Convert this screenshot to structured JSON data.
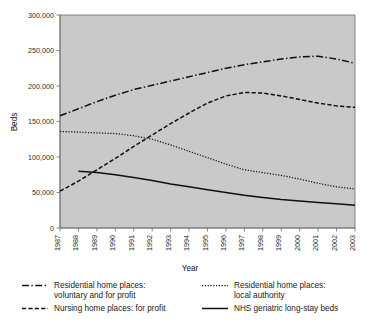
{
  "chart_data": {
    "type": "line",
    "title": "",
    "xlabel": "Year",
    "ylabel": "Beds",
    "x": [
      1987,
      1988,
      1989,
      1990,
      1991,
      1992,
      1993,
      1994,
      1995,
      1996,
      1997,
      1998,
      1999,
      2000,
      2001,
      2002,
      2003
    ],
    "categories": [
      "1987",
      "1988",
      "1989",
      "1990",
      "1991",
      "1992",
      "1993",
      "1994",
      "1995",
      "1996",
      "1997",
      "1998",
      "1999",
      "2000",
      "2001",
      "2002",
      "2003"
    ],
    "xlim": [
      1987,
      2003
    ],
    "ylim": [
      0,
      300000
    ],
    "yticks": [
      0,
      50000,
      100000,
      150000,
      200000,
      250000,
      300000
    ],
    "ytick_labels": [
      "0",
      "50,000",
      "100,000",
      "150,000",
      "200,000",
      "250,000",
      "300,000"
    ],
    "grid": false,
    "legend_position": "bottom",
    "plot_background": "#c9c9c9",
    "series": [
      {
        "name": "Residential home places: voluntary and for profit",
        "legend_label_line1": "Residential home places:",
        "legend_label_line2": "voluntary and for profit",
        "style": "dash-dot",
        "color": "#0f0f0f",
        "values": [
          158000,
          168000,
          178000,
          187000,
          195000,
          201000,
          207000,
          213000,
          219000,
          225000,
          230000,
          234000,
          238000,
          241000,
          242000,
          238000,
          232000
        ]
      },
      {
        "name": "Nursing home places: for profit",
        "legend_label_line1": "Nursing home places: for profit",
        "legend_label_line2": "",
        "style": "dashed",
        "color": "#0f0f0f",
        "values": [
          52000,
          66000,
          82000,
          98000,
          115000,
          131000,
          147000,
          162000,
          176000,
          186000,
          191000,
          190000,
          186000,
          181000,
          176000,
          172000,
          170000
        ]
      },
      {
        "name": "Residential home places: local authority",
        "legend_label_line1": "Residential home places:",
        "legend_label_line2": "local authority",
        "style": "dotted",
        "color": "#1a1a1a",
        "values": [
          136000,
          135000,
          134000,
          133000,
          130000,
          125000,
          117000,
          108000,
          99000,
          90000,
          82000,
          78000,
          74000,
          69000,
          63000,
          58000,
          55000
        ]
      },
      {
        "name": "NHS geriatric long-stay beds",
        "legend_label_line1": "NHS geriatric long-stay beds",
        "legend_label_line2": "",
        "style": "solid",
        "color": "#0f0f0f",
        "values": [
          null,
          80000,
          78000,
          75000,
          71000,
          67000,
          62000,
          58000,
          54000,
          50000,
          46000,
          43000,
          40000,
          38000,
          36000,
          34000,
          32000
        ]
      }
    ]
  },
  "legend": {
    "entries": [
      {
        "swatch": "dash-dot-line-icon",
        "line1": "Residential home places:",
        "line2": "voluntary and for profit"
      },
      {
        "swatch": "dotted-line-icon",
        "line1": "Residential home places:",
        "line2": "local authority"
      },
      {
        "swatch": "dashed-line-icon",
        "line1": "Nursing home places: for profit",
        "line2": ""
      },
      {
        "swatch": "solid-line-icon",
        "line1": "NHS geriatric long-stay beds",
        "line2": ""
      }
    ]
  }
}
